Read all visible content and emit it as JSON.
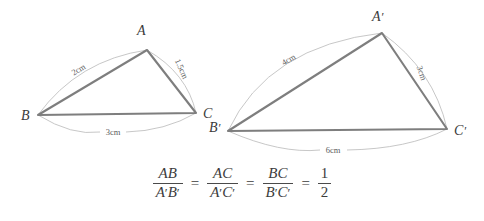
{
  "figure": {
    "background_color": "#ffffff",
    "edge_color": "#7e7e7e",
    "arc_color": "#b9b9b9",
    "label_color": "#3a3a3a"
  },
  "triangle_small": {
    "name": "triangle-abc",
    "vertices": [
      {
        "id": "A",
        "label": "A",
        "x": 147,
        "y": 50,
        "label_x": 137,
        "label_y": 35
      },
      {
        "id": "B",
        "label": "B",
        "x": 38,
        "y": 115,
        "label_x": 21,
        "label_y": 120
      },
      {
        "id": "C",
        "label": "C",
        "x": 196,
        "y": 113,
        "label_x": 203,
        "label_y": 118
      }
    ],
    "side_labels": [
      {
        "id": "AB",
        "text": "2cm",
        "x": 80,
        "y": 72,
        "rotate": -31
      },
      {
        "id": "AC",
        "text": "1.5cm",
        "x": 179,
        "y": 70,
        "rotate": 66
      },
      {
        "id": "BC",
        "text": "3cm",
        "x": 112,
        "y": 132,
        "rotate": 0
      }
    ]
  },
  "triangle_large": {
    "name": "triangle-a-prime-b-prime-c-prime",
    "vertices": [
      {
        "id": "A'",
        "label": "A",
        "prime": "′",
        "x": 382,
        "y": 33,
        "label_x": 372,
        "label_y": 21
      },
      {
        "id": "B'",
        "label": "B",
        "prime": "′",
        "x": 228,
        "y": 131,
        "label_x": 209,
        "label_y": 132
      },
      {
        "id": "C'",
        "label": "C",
        "prime": "′",
        "x": 447,
        "y": 129,
        "label_x": 454,
        "label_y": 135
      }
    ],
    "side_labels": [
      {
        "id": "A'B'",
        "text": "4cm",
        "x": 290,
        "y": 62,
        "rotate": -30
      },
      {
        "id": "A'C'",
        "text": "3cm",
        "x": 419,
        "y": 74,
        "rotate": 71
      },
      {
        "id": "B'C'",
        "text": "6cm",
        "x": 333,
        "y": 150,
        "rotate": 0
      }
    ]
  },
  "equation": {
    "name": "proportion-equation",
    "terms": [
      {
        "num": "AB",
        "num_prime": "",
        "den": "A",
        "den_prime": "′",
        "den2": "B",
        "den2_prime": "′"
      },
      {
        "num": "AC",
        "den": "A",
        "den_prime": "′",
        "den2": "C",
        "den2_prime": "′"
      },
      {
        "num": "BC",
        "den": "B",
        "den_prime": "′",
        "den2": "C",
        "den2_prime": "′"
      }
    ],
    "fraction_1": {
      "num": "AB",
      "den_a": "A",
      "den_b": "B"
    },
    "fraction_2": {
      "num": "AC",
      "den_a": "A",
      "den_b": "C"
    },
    "fraction_3": {
      "num": "BC",
      "den_a": "B",
      "den_b": "C"
    },
    "fraction_4": {
      "num": "1",
      "den": "2"
    },
    "equals": "=",
    "prime": "′",
    "plain_text": "AB/A′B′ = AC/A′C′ = BC/B′C′ = 1/2"
  }
}
